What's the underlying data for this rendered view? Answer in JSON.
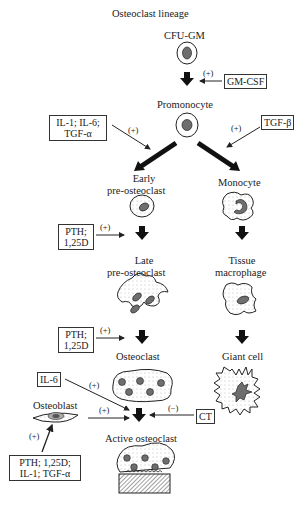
{
  "title": "Osteoclast lineage",
  "nodes": {
    "cfu_gm": "CFU-GM",
    "promonocyte": "Promonocyte",
    "early_pre_1": "Early",
    "early_pre_2": "pre-osteoclast",
    "monocyte": "Monocyte",
    "late_pre_1": "Late",
    "late_pre_2": "pre-osteoclast",
    "tissue_1": "Tissue",
    "tissue_2": "macrophage",
    "osteoclast": "Osteoclast",
    "giant_cell": "Giant cell",
    "osteoblast": "Osteoblast",
    "active_osteoclast": "Active osteoclast"
  },
  "factors": {
    "gm_csf": "GM-CSF",
    "il1_il6_1": "IL-1; IL-6;",
    "il1_il6_2": "TGF-α",
    "tgf_beta": "TGF-β",
    "pth1_1": "PTH;",
    "pth1_2": "1,25D",
    "pth2_1": "PTH;",
    "pth2_2": "1,25D",
    "il6": "IL-6",
    "ct": "CT",
    "pth3_1": "PTH; 1,25D;",
    "pth3_2": "IL-1; TGF-α"
  },
  "signs": {
    "plus": "(+)",
    "minus": "(−)"
  },
  "colors": {
    "nucleus": "#6e6e6e",
    "stroke": "#222222"
  }
}
